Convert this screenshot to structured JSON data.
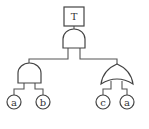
{
  "diagram": {
    "type": "fault-tree",
    "top_event": {
      "label": "T"
    },
    "top_gate": {
      "type": "AND"
    },
    "left_gate": {
      "type": "AND",
      "inputs": [
        "a",
        "b"
      ]
    },
    "right_gate": {
      "type": "OR",
      "inputs": [
        "c",
        "a"
      ]
    },
    "basic_events": [
      {
        "label": "a"
      },
      {
        "label": "b"
      },
      {
        "label": "c"
      },
      {
        "label": "a"
      }
    ]
  }
}
